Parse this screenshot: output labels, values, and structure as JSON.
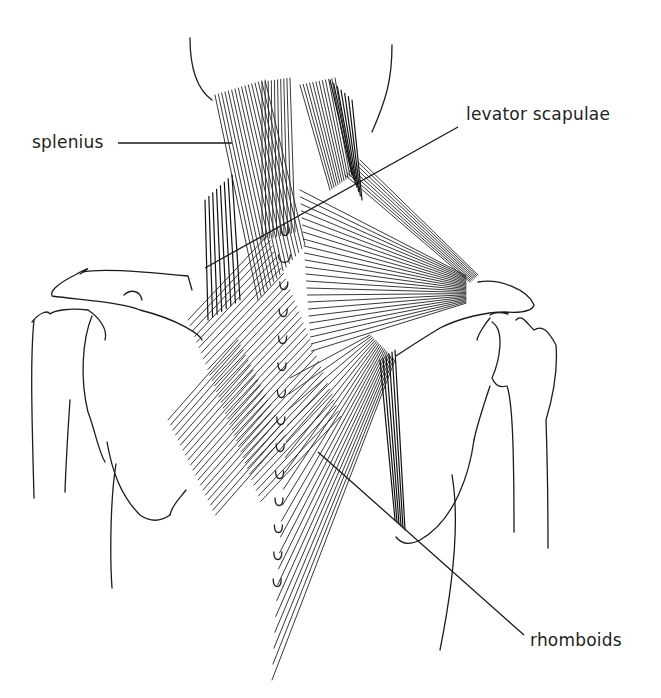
{
  "figure": {
    "background": "#ffffff",
    "ink_color": "#1c1c1c"
  },
  "labels": [
    {
      "id": "splenius",
      "text": "splenius",
      "x": 32,
      "y": 134,
      "leader": [
        [
          118,
          143
        ],
        [
          232,
          143
        ]
      ]
    },
    {
      "id": "levator-scapulae",
      "text": "levator scapulae",
      "x": 466,
      "y": 106,
      "leader": [
        [
          458,
          127
        ],
        [
          205,
          268
        ]
      ]
    },
    {
      "id": "rhomboids",
      "text": "rhomboids",
      "x": 530,
      "y": 632,
      "leader": [
        [
          524,
          635
        ],
        [
          318,
          452
        ]
      ]
    }
  ],
  "muscles": [
    {
      "name": "splenius",
      "fiber_count": 16
    },
    {
      "name": "levator scapulae",
      "fiber_count": 8
    },
    {
      "name": "trapezius (upper)",
      "fiber_count": 24
    },
    {
      "name": "rhomboids",
      "fiber_count": 20
    }
  ],
  "spine": {
    "vertebra_count": 14,
    "x": 285,
    "y_start": 232,
    "y_step": 27
  }
}
